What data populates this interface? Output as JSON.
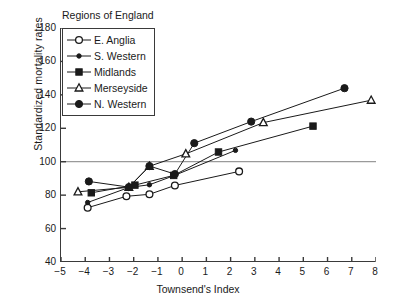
{
  "chart_data": {
    "type": "line",
    "title": "",
    "xlabel": "Townsend's Index",
    "ylabel": "Standardized mortality rates",
    "xlim": [
      -5,
      8
    ],
    "ylim": [
      40,
      180
    ],
    "xticks": [
      "-5",
      "-4",
      "-3",
      "-2",
      "-1",
      "0",
      "1",
      "2",
      "3",
      "4",
      "5",
      "6",
      "7",
      "8"
    ],
    "xtick_values": [
      -5,
      -4,
      -3,
      -2,
      -1,
      0,
      1,
      2,
      3,
      4,
      5,
      6,
      7,
      8
    ],
    "yticks": [
      "40",
      "60",
      "80",
      "100",
      "120",
      "140",
      "160",
      "180"
    ],
    "ytick_values": [
      40,
      60,
      80,
      100,
      120,
      140,
      160,
      180
    ],
    "grid": false,
    "reference_lines": [
      {
        "axis": "y",
        "value": 100,
        "color": "#9a9a9a"
      }
    ],
    "legend_title": "Regions of England",
    "legend_position": "top-left-inside",
    "series": [
      {
        "name": "E. Anglia",
        "marker": "open-circle",
        "color": "#1a1a1a",
        "points": [
          {
            "x": -3.9,
            "y": 72.5
          },
          {
            "x": -2.3,
            "y": 79.3
          },
          {
            "x": -1.35,
            "y": 80.5
          },
          {
            "x": -0.3,
            "y": 85.8
          },
          {
            "x": 2.35,
            "y": 94.2
          }
        ]
      },
      {
        "name": "S. Western",
        "marker": "small-filled-circle",
        "color": "#1a1a1a",
        "points": [
          {
            "x": -3.9,
            "y": 75.6
          },
          {
            "x": -2.2,
            "y": 84.6
          },
          {
            "x": -1.35,
            "y": 86.2
          },
          {
            "x": -0.35,
            "y": 91.6
          },
          {
            "x": 2.2,
            "y": 106.8
          }
        ]
      },
      {
        "name": "Midlands",
        "marker": "filled-square",
        "color": "#1a1a1a",
        "points": [
          {
            "x": -3.75,
            "y": 81.4
          },
          {
            "x": -1.95,
            "y": 86.0
          },
          {
            "x": -0.35,
            "y": 91.8
          },
          {
            "x": 1.5,
            "y": 105.8
          },
          {
            "x": 5.4,
            "y": 121.3
          }
        ]
      },
      {
        "name": "Merseyside",
        "marker": "open-triangle",
        "color": "#1a1a1a",
        "points": [
          {
            "x": -4.3,
            "y": 82.0
          },
          {
            "x": -2.2,
            "y": 84.7
          },
          {
            "x": -1.35,
            "y": 97.3
          },
          {
            "x": 0.15,
            "y": 104.7
          },
          {
            "x": 3.35,
            "y": 123.4
          },
          {
            "x": 7.8,
            "y": 136.8
          }
        ]
      },
      {
        "name": "N. Western",
        "marker": "filled-circle",
        "color": "#1a1a1a",
        "points": [
          {
            "x": -3.85,
            "y": 88.2
          },
          {
            "x": -2.2,
            "y": 84.8
          },
          {
            "x": -1.35,
            "y": 97.4
          },
          {
            "x": -0.3,
            "y": 92.6
          },
          {
            "x": 0.5,
            "y": 111.1
          },
          {
            "x": 2.85,
            "y": 124.0
          },
          {
            "x": 6.7,
            "y": 144.0
          }
        ]
      }
    ]
  }
}
